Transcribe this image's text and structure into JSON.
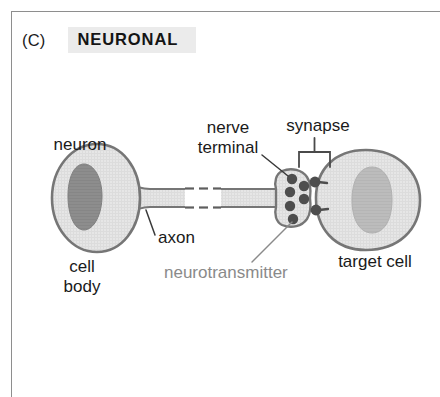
{
  "panel": {
    "letter": "(C)",
    "title": "NEURONAL"
  },
  "labels": {
    "neuron": "neuron",
    "cell_body_line1": "cell",
    "cell_body_line2": "body",
    "axon": "axon",
    "nerve_terminal_line1": "nerve",
    "nerve_terminal_line2": "terminal",
    "synapse": "synapse",
    "neurotransmitter": "neurotransmitter",
    "target_cell": "target cell"
  },
  "colors": {
    "ink": "#1a1a1a",
    "gray_label": "#8a8a8a",
    "cell_fill": "#e4e4e4",
    "cell_outline": "#767676",
    "neuron_nucleus": "#8d8d8d",
    "target_nucleus": "#bcbcbc",
    "vesicle": "#4a4a4a",
    "frame": "#8e8e8e",
    "title_highlight": "#ebebeb",
    "background": "#ffffff"
  },
  "diagram": {
    "type": "neuronal-signaling-schematic",
    "parts": [
      "neuron cell body",
      "nucleus",
      "axon",
      "axon break (dashed)",
      "nerve terminal",
      "synaptic vesicles",
      "neurotransmitter in cleft",
      "target cell",
      "target cell nucleus",
      "synapse bracket"
    ],
    "vesicle_count_terminal": 4,
    "vesicle_count_cleft": 4
  }
}
